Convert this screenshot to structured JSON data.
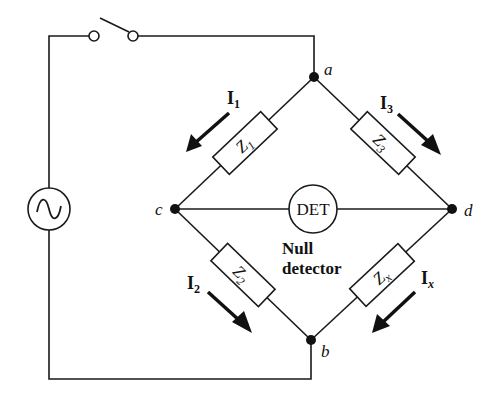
{
  "diagram": {
    "nodes": {
      "a": "a",
      "b": "b",
      "c": "c",
      "d": "d"
    },
    "impedances": {
      "z1": {
        "main": "Z",
        "sub": "1"
      },
      "z2": {
        "main": "Z",
        "sub": "2"
      },
      "z3": {
        "main": "Z",
        "sub": "3"
      },
      "zx": {
        "main": "Z",
        "sub": "x"
      }
    },
    "currents": {
      "i1": {
        "main": "I",
        "sub": "1"
      },
      "i2": {
        "main": "I",
        "sub": "2"
      },
      "i3": {
        "main": "I",
        "sub": "3"
      },
      "ix": {
        "main": "I",
        "sub": "x"
      }
    },
    "detector": {
      "label": "DET",
      "caption_line1": "Null",
      "caption_line2": "detector"
    },
    "source": {
      "symbol": "ac-source"
    },
    "switch": {
      "state": "open"
    },
    "colors": {
      "line": "#1a1a1a",
      "background": "#ffffff"
    }
  }
}
